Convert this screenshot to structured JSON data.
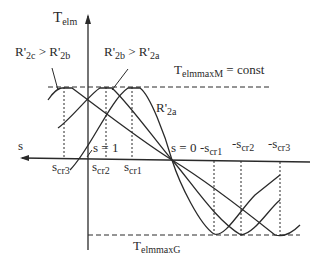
{
  "diagram": {
    "axes": {
      "y_label": "T",
      "y_label_sub": "elm",
      "x_label": "s"
    },
    "annotations": {
      "r2c_gt_r2b": {
        "a": "R'",
        "a_sub": "2c",
        "op": " > ",
        "b": "R'",
        "b_sub": "2b"
      },
      "r2b_gt_r2a": {
        "a": "R'",
        "a_sub": "2b",
        "op": " > ",
        "b": "R'",
        "b_sub": "2a"
      },
      "r2a": {
        "a": "R'",
        "a_sub": "2a"
      },
      "tmax_motor": {
        "base": "T",
        "sub": "elmmaxM",
        "rest": " = const"
      },
      "tmax_gen": {
        "base": "T",
        "sub": "elmmaxG"
      },
      "s_eq_1": "s = 1",
      "s_eq_0": "s = 0",
      "ticks_left": [
        {
          "base": "s",
          "sub": "cr3"
        },
        {
          "base": "s",
          "sub": "cr2"
        },
        {
          "base": "s",
          "sub": "cr1"
        }
      ],
      "ticks_right": [
        {
          "base": "-s",
          "sub": "cr1"
        },
        {
          "base": "-s",
          "sub": "cr2"
        },
        {
          "base": "-s",
          "sub": "cr3"
        }
      ]
    },
    "colors": {
      "line": "#2a2a2a",
      "background": "#ffffff"
    }
  }
}
